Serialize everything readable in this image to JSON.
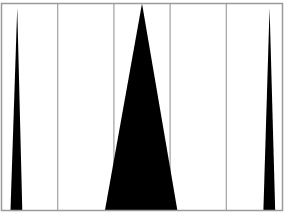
{
  "chart_data": {
    "type": "area",
    "title": "",
    "xlabel": "",
    "ylabel": "",
    "xlim": [
      0,
      5
    ],
    "ylim": [
      0,
      1
    ],
    "grid": {
      "vertical": true,
      "horizontal": false
    },
    "gridlines_x": [
      1,
      2,
      3,
      4
    ],
    "legend": null,
    "series": [
      {
        "name": "peak-1",
        "shape": "triangle",
        "x_left": 0.16,
        "x_peak": 0.28,
        "x_right": 0.37,
        "height": 0.98
      },
      {
        "name": "peak-2",
        "shape": "triangle",
        "x_left": 1.84,
        "x_peak": 2.5,
        "x_right": 3.13,
        "height": 1.0
      },
      {
        "name": "peak-3",
        "shape": "triangle",
        "x_left": 4.66,
        "x_peak": 4.77,
        "x_right": 4.87,
        "height": 0.98
      }
    ]
  },
  "style": {
    "fill_color": "#000000",
    "grid_color": "#a0a0a0",
    "frame_color": "#9a9a9a",
    "background": "#ffffff"
  }
}
